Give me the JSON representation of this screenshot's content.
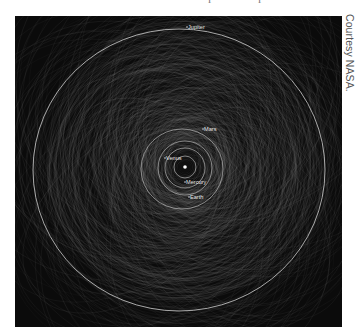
{
  "figure": {
    "title_fragments": [
      "i",
      "i"
    ],
    "credit": "Courtesy NASA.",
    "background_color": "#0b0b0b",
    "orbit_color": "#d8d8d8",
    "web_color": "#8a8a8a",
    "sun": {
      "label": "",
      "x": 170,
      "y": 151
    },
    "planets": [
      {
        "name": "Mercury",
        "label": "Mercury",
        "label_x": 171,
        "label_y": 168,
        "rx": 11,
        "ry": 11,
        "cx": 170,
        "cy": 151
      },
      {
        "name": "Venus",
        "label": "Venus",
        "label_x": 151,
        "label_y": 144,
        "rx": 20,
        "ry": 20,
        "cx": 170,
        "cy": 152
      },
      {
        "name": "Earth",
        "label": "Earth",
        "label_x": 175,
        "label_y": 183,
        "rx": 27,
        "ry": 27,
        "cx": 170,
        "cy": 152
      },
      {
        "name": "Mars",
        "label": "Mars",
        "label_x": 189,
        "label_y": 115,
        "rx": 41,
        "ry": 40,
        "cx": 167,
        "cy": 153
      },
      {
        "name": "Jupiter",
        "label": "Jupiter",
        "label_x": 173,
        "label_y": 13,
        "rx": 146,
        "ry": 141,
        "cx": 164,
        "cy": 154
      }
    ]
  }
}
